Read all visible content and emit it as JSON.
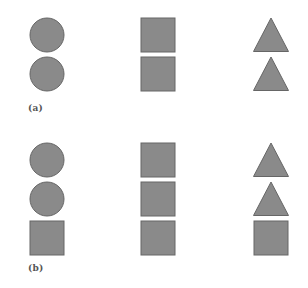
{
  "figure": {
    "colors": {
      "shape_fill": "#8a8a8a",
      "shape_stroke": "#666666",
      "background": "#ffffff",
      "label": "#555555"
    },
    "panels": [
      {
        "id": "a",
        "label": "(a)",
        "columns": [
          {
            "name": "left-column",
            "shapes": [
              "circle",
              "circle"
            ]
          },
          {
            "name": "middle-column",
            "shapes": [
              "square",
              "square"
            ]
          },
          {
            "name": "right-column",
            "shapes": [
              "triangle",
              "triangle"
            ]
          }
        ]
      },
      {
        "id": "b",
        "label": "(b)",
        "columns": [
          {
            "name": "left-column",
            "shapes": [
              "circle",
              "circle",
              "square"
            ]
          },
          {
            "name": "middle-column",
            "shapes": [
              "square",
              "square",
              "square"
            ]
          },
          {
            "name": "right-column",
            "shapes": [
              "triangle",
              "triangle",
              "square"
            ]
          }
        ]
      }
    ]
  }
}
